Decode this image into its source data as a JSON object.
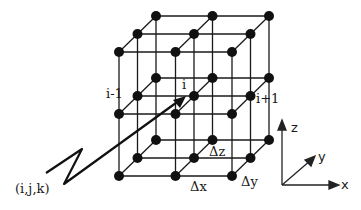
{
  "diagram": {
    "labels": {
      "i_minus_1": "i-1",
      "i": "i",
      "i_plus_1": "i+1",
      "delta_z": "Δz",
      "delta_x": "Δx",
      "delta_y": "Δy",
      "index": "(i,j,k)"
    },
    "axes": {
      "z": "z",
      "y": "y",
      "x": "x"
    },
    "colors": {
      "line": "#1a1a1a",
      "node": "#111111",
      "background": "#ffffff"
    },
    "grid": {
      "nx": 3,
      "ny": 3,
      "nz": 3
    }
  }
}
